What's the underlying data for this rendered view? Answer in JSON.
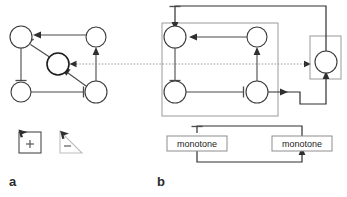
{
  "figure": {
    "background_color": "#ffffff",
    "width": 347,
    "height": 197,
    "panels": [
      {
        "id": "a",
        "label": "a",
        "description": "Unstructured signed interaction graph with five nodes"
      },
      {
        "id": "b",
        "label": "b",
        "description": "Decomposed graph with grouping boxes and monotone subsystem blocks"
      }
    ]
  },
  "panel_a": {
    "label": "a",
    "nodes": [
      {
        "id": "a-n1",
        "name": "node-top-left",
        "cx": 21,
        "cy": 37,
        "r": 11,
        "emphasis": "normal"
      },
      {
        "id": "a-n2",
        "name": "node-top-right",
        "cx": 96,
        "cy": 37,
        "r": 10,
        "emphasis": "normal"
      },
      {
        "id": "a-n3",
        "name": "node-center",
        "cx": 58,
        "cy": 64,
        "r": 11,
        "emphasis": "thick"
      },
      {
        "id": "a-n4",
        "name": "node-bottom-left",
        "cx": 21,
        "cy": 92,
        "r": 10,
        "emphasis": "normal"
      },
      {
        "id": "a-n5",
        "name": "node-bottom-right",
        "cx": 96,
        "cy": 92,
        "r": 11,
        "emphasis": "normal"
      }
    ],
    "edges": [
      {
        "id": "a-e1",
        "name": "edge-top-right-to-top-left",
        "from": "a-n2",
        "to": "a-n1",
        "kind": "activation"
      },
      {
        "id": "a-e2",
        "name": "edge-center-to-top-left",
        "from": "a-n3",
        "to": "a-n1",
        "kind": "inhibition"
      },
      {
        "id": "a-e3",
        "name": "edge-top-left-to-bottom-left",
        "from": "a-n1",
        "to": "a-n4",
        "kind": "inhibition"
      },
      {
        "id": "a-e4",
        "name": "edge-bottom-left-to-bottom-right",
        "from": "a-n4",
        "to": "a-n5",
        "kind": "inhibition"
      },
      {
        "id": "a-e5",
        "name": "edge-bottom-right-to-top-right",
        "from": "a-n5",
        "to": "a-n2",
        "kind": "activation"
      },
      {
        "id": "a-e6",
        "name": "edge-bottom-right-to-center",
        "from": "a-n5",
        "to": "a-n3",
        "kind": "activation"
      }
    ],
    "legend_icons": [
      {
        "id": "icon-square-plus",
        "name": "square-plus-cursor-icon",
        "glyph": "+",
        "shape": "square"
      },
      {
        "id": "icon-triangle-minus",
        "name": "triangle-minus-cursor-icon",
        "glyph": "-",
        "shape": "triangle"
      }
    ]
  },
  "panel_b": {
    "label": "b",
    "nodes": [
      {
        "id": "b-n1",
        "name": "node-top-left",
        "cx": 175,
        "cy": 37,
        "r": 11,
        "emphasis": "normal"
      },
      {
        "id": "b-n2",
        "name": "node-top-right",
        "cx": 257,
        "cy": 37,
        "r": 10,
        "emphasis": "normal"
      },
      {
        "id": "b-n3",
        "name": "node-bottom-left",
        "cx": 175,
        "cy": 92,
        "r": 11,
        "emphasis": "normal"
      },
      {
        "id": "b-n4",
        "name": "node-bottom-right",
        "cx": 257,
        "cy": 92,
        "r": 11,
        "emphasis": "normal"
      },
      {
        "id": "b-n5",
        "name": "node-feedback",
        "cx": 326,
        "cy": 62,
        "r": 11,
        "emphasis": "normal"
      }
    ],
    "edges": [
      {
        "id": "b-e1",
        "name": "edge-top-right-to-top-left",
        "from": "b-n2",
        "to": "b-n1",
        "kind": "activation"
      },
      {
        "id": "b-e2",
        "name": "edge-top-left-to-bottom-left",
        "from": "b-n1",
        "to": "b-n3",
        "kind": "inhibition"
      },
      {
        "id": "b-e3",
        "name": "edge-bottom-left-to-bottom-right",
        "from": "b-n3",
        "to": "b-n4",
        "kind": "inhibition"
      },
      {
        "id": "b-e4",
        "name": "edge-bottom-right-to-top-right",
        "from": "b-n4",
        "to": "b-n2",
        "kind": "activation"
      },
      {
        "id": "b-e5",
        "name": "edge-bottom-right-to-feedback",
        "from": "b-n4",
        "to": "b-n5",
        "kind": "activation"
      },
      {
        "id": "b-e6",
        "name": "edge-feedback-to-top-left",
        "from": "b-n5",
        "to": "b-n1",
        "kind": "inhibition"
      },
      {
        "id": "b-e7",
        "name": "edge-dotted-into-feedback",
        "from": "panel-a-center",
        "to": "b-n5",
        "kind": "dotted-activation"
      }
    ],
    "containers": [
      {
        "id": "b-box-main",
        "name": "grouping-box-main",
        "x": 162,
        "y": 23,
        "width": 116,
        "height": 93
      },
      {
        "id": "b-box-feedback",
        "name": "grouping-box-feedback",
        "x": 310,
        "y": 36,
        "width": 31,
        "height": 43
      }
    ],
    "monotone_blocks": [
      {
        "id": "b-mono-left",
        "name": "monotone-block-left",
        "label": "monotone",
        "x": 167,
        "y": 136,
        "width": 60,
        "height": 15
      },
      {
        "id": "b-mono-right",
        "name": "monotone-block-right",
        "label": "monotone",
        "x": 272,
        "y": 136,
        "width": 60,
        "height": 15
      }
    ],
    "monotone_edges": [
      {
        "id": "b-me1",
        "name": "edge-monotone-left-to-right",
        "from": "b-mono-left",
        "to": "b-mono-right",
        "kind": "activation"
      },
      {
        "id": "b-me2",
        "name": "edge-monotone-right-to-left",
        "from": "b-mono-right",
        "to": "b-mono-left",
        "kind": "inhibition"
      }
    ]
  },
  "shared": {
    "dotted_connector": {
      "name": "dotted-separator-connector",
      "y": 64,
      "x_start": 73,
      "x_end": 309,
      "style": "dotted",
      "color": "#8c8c8c"
    }
  },
  "colors": {
    "background": "#ffffff",
    "node_stroke": "#3a3a3a",
    "edge": "#4a4a4a",
    "container_stroke": "#9a9a9a",
    "dotted": "#8c8c8c",
    "text": "#1d1d1d",
    "label_bold": "#2b2b2b"
  }
}
